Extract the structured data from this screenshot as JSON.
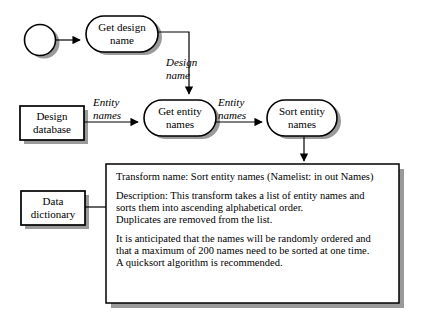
{
  "diagram": {
    "background_color": "#ffffff",
    "stroke_color": "#000000",
    "shadow_color": "#9a9a9a",
    "nodes": [
      {
        "id": "start",
        "type": "start-circle",
        "label": ""
      },
      {
        "id": "get-design-name",
        "type": "stadium",
        "label_line1": "Get design",
        "label_line2": "name"
      },
      {
        "id": "design-database",
        "type": "store-rect",
        "label_line1": "Design",
        "label_line2": "database"
      },
      {
        "id": "get-entity-names",
        "type": "stadium",
        "label_line1": "Get entity",
        "label_line2": "names"
      },
      {
        "id": "sort-entity-names",
        "type": "stadium",
        "label_line1": "Sort entity",
        "label_line2": "names"
      },
      {
        "id": "data-dictionary",
        "type": "store-rect",
        "label_line1": "Data",
        "label_line2": "dictionary"
      }
    ],
    "flow_labels": [
      {
        "id": "design-name",
        "line1": "Design",
        "line2": "name"
      },
      {
        "id": "entity-names-left",
        "line1": "Entity",
        "line2": "names"
      },
      {
        "id": "entity-names-right",
        "line1": "Entity",
        "line2": "names"
      }
    ],
    "spec_box": {
      "id": "transform-spec",
      "lines": [
        "Transform name: Sort entity names (Namelist: in out Names)",
        "",
        "Description: This transform takes a list of entity names and",
        "sorts them into ascending alphabetical order.",
        "Duplicates are removed from the list.",
        "",
        "It is anticipated that the names will be randomly ordered and",
        "that a maximum of 200 names need to be sorted at one time.",
        "A quicksort algorithm is recommended."
      ]
    }
  }
}
